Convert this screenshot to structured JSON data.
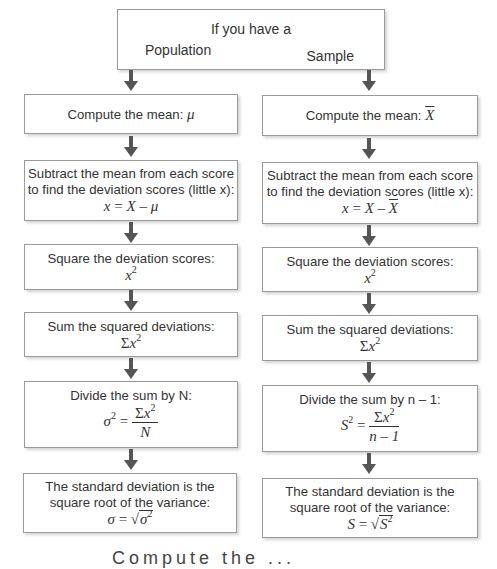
{
  "top": {
    "title": "If you have a",
    "left_label": "Population",
    "right_label": "Sample"
  },
  "population": {
    "mean": {
      "text": "Compute the mean:",
      "symbol": "μ"
    },
    "deviation": {
      "line1": "Subtract the mean from each score",
      "line2": "to find the deviation scores (little x):",
      "formula_lhs": "x",
      "formula_eq": " = ",
      "formula_X": "X",
      "formula_minus": " – ",
      "formula_mean": "μ"
    },
    "square": {
      "text": "Square the deviation scores:",
      "base": "x",
      "exp": "2"
    },
    "sum": {
      "text": "Sum the squared deviations:",
      "sigma": "Σ",
      "base": "x",
      "exp": "2"
    },
    "divide": {
      "text": "Divide the sum by N:",
      "lhs": "σ",
      "lhs_exp": "2",
      "eq": " = ",
      "num_sigma": "Σ",
      "num_base": "x",
      "num_exp": "2",
      "den": "N"
    },
    "stddev": {
      "line1": "The standard deviation is the",
      "line2": "square root of the variance:",
      "lhs": "σ",
      "eq": " = ",
      "root": "√",
      "rad": "σ",
      "rad_exp": "2"
    }
  },
  "sample": {
    "mean": {
      "text": "Compute the mean:",
      "symbol": "X"
    },
    "deviation": {
      "line1": "Subtract the mean from each score",
      "line2": "to find the deviation scores (little x):",
      "formula_lhs": "x",
      "formula_eq": " = ",
      "formula_X": "X",
      "formula_minus": " – ",
      "formula_mean": "X"
    },
    "square": {
      "text": "Square the deviation scores:",
      "base": "x",
      "exp": "2"
    },
    "sum": {
      "text": "Sum the squared deviations:",
      "sigma": "Σ",
      "base": "x",
      "exp": "2"
    },
    "divide": {
      "text": "Divide the sum by n – 1:",
      "lhs": "S",
      "lhs_exp": "2",
      "eq": " = ",
      "num_sigma": "Σ",
      "num_base": "x",
      "num_exp": "2",
      "den": "n – 1"
    },
    "stddev": {
      "line1": "The standard deviation is the",
      "line2": "square root of the variance:",
      "lhs": "S",
      "eq": " = ",
      "root": "√",
      "rad": "S",
      "rad_exp": "2"
    }
  },
  "footer_cut": "Compute the ..."
}
